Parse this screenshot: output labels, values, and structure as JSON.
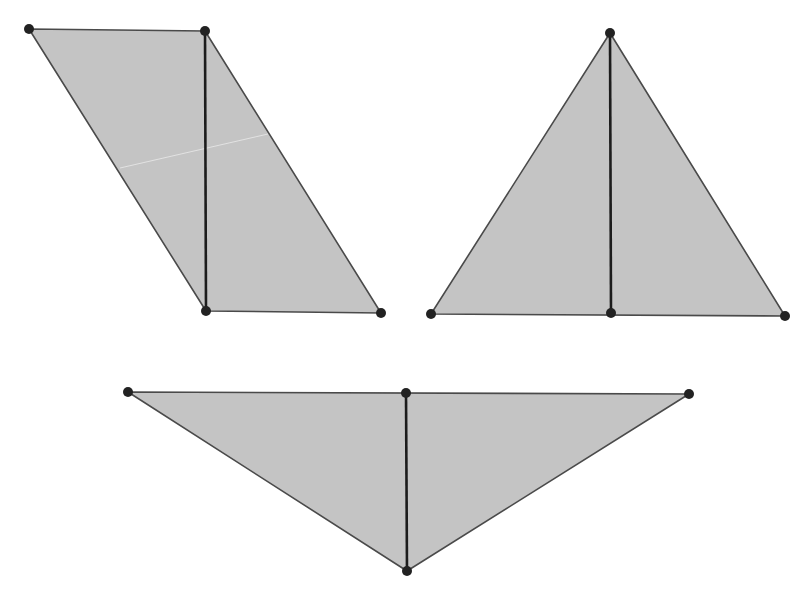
{
  "canvas": {
    "width": 812,
    "height": 603,
    "background": "#ffffff"
  },
  "colors": {
    "fill": "#c4c4c4",
    "edge": "#4a4a4a",
    "height_line": "#1c1c1c",
    "vertex": "#222222",
    "crease": "#e2e2e2"
  },
  "figures": [
    {
      "name": "parallelogram",
      "polygon": [
        [
          29,
          29
        ],
        [
          205,
          31
        ],
        [
          381,
          313
        ],
        [
          206,
          311
        ]
      ],
      "height_segment": [
        [
          205,
          31
        ],
        [
          206,
          311
        ]
      ],
      "crease": [
        [
          120,
          168
        ],
        [
          268,
          134
        ]
      ],
      "vertices": [
        [
          29,
          29
        ],
        [
          205,
          31
        ],
        [
          206,
          311
        ],
        [
          381,
          313
        ]
      ]
    },
    {
      "name": "isosceles-triangle",
      "polygon": [
        [
          610,
          33
        ],
        [
          785,
          316
        ],
        [
          431,
          314
        ]
      ],
      "height_segment": [
        [
          610,
          33
        ],
        [
          611,
          313
        ]
      ],
      "vertices": [
        [
          610,
          33
        ],
        [
          431,
          314
        ],
        [
          611,
          313
        ],
        [
          785,
          316
        ]
      ]
    },
    {
      "name": "obtuse-triangle",
      "polygon": [
        [
          128,
          392
        ],
        [
          689,
          394
        ],
        [
          407,
          571
        ]
      ],
      "height_segment": [
        [
          406,
          393
        ],
        [
          407,
          571
        ]
      ],
      "vertices": [
        [
          128,
          392
        ],
        [
          406,
          393
        ],
        [
          689,
          394
        ],
        [
          407,
          571
        ]
      ]
    }
  ]
}
